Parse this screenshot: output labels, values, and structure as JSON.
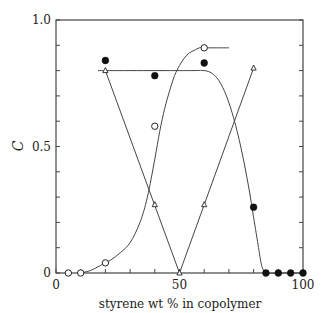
{
  "chart_data": {
    "type": "line",
    "title": "",
    "xlabel": "styrene wt % in copolymer",
    "ylabel": "C",
    "xlim": [
      0,
      100
    ],
    "ylim": [
      0,
      1.0
    ],
    "x_ticks": [
      0,
      10,
      20,
      30,
      40,
      50,
      60,
      70,
      80,
      90,
      100
    ],
    "x_tick_labels": [
      "0",
      "50",
      "100"
    ],
    "x_tick_label_values": [
      0,
      50,
      100
    ],
    "y_ticks": [
      0,
      0.1,
      0.2,
      0.3,
      0.4,
      0.5,
      0.6,
      0.7,
      0.8,
      0.9,
      1.0
    ],
    "y_tick_labels": [
      "0",
      "0.5",
      "1.0"
    ],
    "y_tick_label_values": [
      0,
      0.5,
      1.0
    ],
    "grid": false,
    "legend": null,
    "series": [
      {
        "name": "open circles",
        "marker": "open-circle",
        "x": [
          5,
          10,
          20,
          40,
          60
        ],
        "y": [
          0.0,
          0.0,
          0.04,
          0.58,
          0.89
        ],
        "curve_x": [
          10,
          14,
          18,
          22,
          26,
          30,
          34,
          37,
          40,
          42,
          44,
          46,
          48,
          50,
          52,
          54,
          56,
          58,
          60,
          65,
          70
        ],
        "curve_y": [
          0.0,
          0.01,
          0.03,
          0.05,
          0.08,
          0.12,
          0.2,
          0.3,
          0.45,
          0.56,
          0.65,
          0.72,
          0.78,
          0.82,
          0.85,
          0.87,
          0.88,
          0.89,
          0.89,
          0.89,
          0.89
        ]
      },
      {
        "name": "filled circles",
        "marker": "filled-circle",
        "x": [
          20,
          40,
          60,
          80,
          85,
          90,
          95,
          100
        ],
        "y": [
          0.84,
          0.78,
          0.83,
          0.26,
          0.0,
          0.0,
          0.0,
          0.0
        ],
        "curve_x": [
          17,
          25,
          35,
          45,
          55,
          60,
          63,
          66,
          69,
          72,
          75,
          78,
          80,
          82,
          83,
          84,
          85,
          90,
          95,
          100
        ],
        "curve_y": [
          0.8,
          0.8,
          0.8,
          0.8,
          0.8,
          0.8,
          0.79,
          0.76,
          0.7,
          0.61,
          0.49,
          0.34,
          0.22,
          0.1,
          0.04,
          0.01,
          0.0,
          0.0,
          0.0,
          0.0
        ]
      },
      {
        "name": "triangles",
        "marker": "open-triangle",
        "x": [
          20,
          40,
          50,
          60,
          80
        ],
        "y": [
          0.8,
          0.27,
          0.0,
          0.27,
          0.81
        ],
        "curve_x": [
          20,
          50,
          80
        ],
        "curve_y": [
          0.8,
          0.0,
          0.81
        ]
      }
    ]
  }
}
